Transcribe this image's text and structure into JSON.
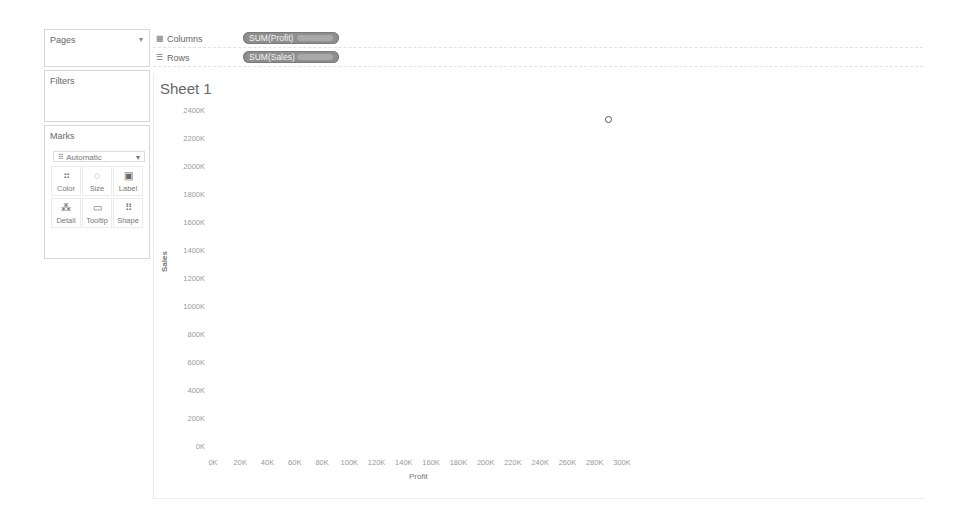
{
  "cards": {
    "pages": {
      "title": "Pages",
      "caret": "▾"
    },
    "filters": {
      "title": "Filters"
    },
    "marks": {
      "title": "Marks",
      "type_dropdown": {
        "icon": "⠿",
        "value": "Automatic",
        "caret": "▾"
      },
      "buttons": [
        {
          "id": "color",
          "label": "Color",
          "icon": "⠶"
        },
        {
          "id": "size",
          "label": "Size",
          "icon": "◌"
        },
        {
          "id": "label",
          "label": "Label",
          "icon": "▣"
        },
        {
          "id": "detail",
          "label": "Detail",
          "icon": "⁂"
        },
        {
          "id": "tooltip",
          "label": "Tooltip",
          "icon": "▭"
        },
        {
          "id": "shape",
          "label": "Shape",
          "icon": "⠿"
        }
      ]
    }
  },
  "shelves": {
    "columns": {
      "icon": "▦",
      "label": "Columns",
      "pill": "SUM(Profit)"
    },
    "rows": {
      "icon": "☰",
      "label": "Rows",
      "pill": "SUM(Sales)"
    }
  },
  "sheet": {
    "title": "Sheet 1"
  },
  "chart_data": {
    "type": "scatter",
    "title": "Sheet 1",
    "xlabel": "Profit",
    "ylabel": "Sales",
    "x_ticks": [
      "0K",
      "20K",
      "40K",
      "60K",
      "80K",
      "100K",
      "120K",
      "140K",
      "160K",
      "180K",
      "200K",
      "220K",
      "240K",
      "260K",
      "280K",
      "300K"
    ],
    "y_ticks": [
      "0K",
      "200K",
      "400K",
      "600K",
      "800K",
      "1000K",
      "1200K",
      "1400K",
      "1600K",
      "1800K",
      "2000K",
      "2200K",
      "2400K"
    ],
    "xlim": [
      0,
      300000
    ],
    "ylim": [
      0,
      2400000
    ],
    "grid": false,
    "points": [
      {
        "x": 290000,
        "y": 2340000
      }
    ]
  }
}
